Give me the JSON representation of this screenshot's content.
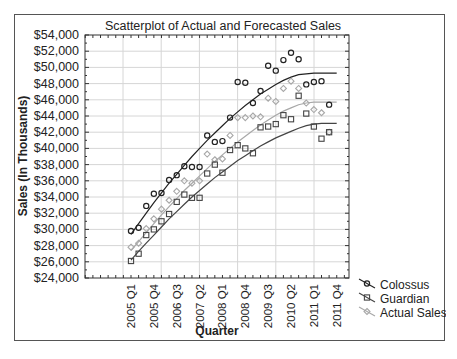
{
  "chart_data": {
    "type": "scatter",
    "title": "Scatterplot of Actual and Forecasted Sales",
    "xlabel": "Quarter",
    "ylabel": "Sales (In Thousands)",
    "ylim": [
      24000,
      54000
    ],
    "ytick_step": 2000,
    "yticks": [
      "$24,000",
      "$26,000",
      "$28,000",
      "$30,000",
      "$32,000",
      "$34,000",
      "$36,000",
      "$38,000",
      "$40,000",
      "$42,000",
      "$44,000",
      "$46,000",
      "$48,000",
      "$50,000",
      "$52,000",
      "$54,000"
    ],
    "xtick_labels": [
      "2005 Q1",
      "2005 Q4",
      "2006 Q3",
      "2007 Q2",
      "2008 Q1",
      "2008 Q4",
      "2009 Q3",
      "2010 Q2",
      "2011 Q1",
      "2011 Q4"
    ],
    "xtick_every": 3,
    "categories": [
      "2005 Q1",
      "2005 Q2",
      "2005 Q3",
      "2005 Q4",
      "2006 Q1",
      "2006 Q2",
      "2006 Q3",
      "2006 Q4",
      "2007 Q1",
      "2007 Q2",
      "2007 Q3",
      "2007 Q4",
      "2008 Q1",
      "2008 Q2",
      "2008 Q3",
      "2008 Q4",
      "2009 Q1",
      "2009 Q2",
      "2009 Q3",
      "2009 Q4",
      "2010 Q1",
      "2010 Q2",
      "2010 Q3",
      "2010 Q4",
      "2011 Q1",
      "2011 Q2",
      "2011 Q3",
      "2011 Q4"
    ],
    "grid": true,
    "legend_position": "right-bottom",
    "series": [
      {
        "name": "Colossus",
        "marker": "circle",
        "color": "#222222",
        "values": [
          29800,
          30200,
          32900,
          34400,
          34500,
          36100,
          36700,
          37800,
          37700,
          37700,
          41600,
          40800,
          40900,
          43800,
          48200,
          48100,
          45600,
          47100,
          50200,
          49600,
          50900,
          51800,
          51000,
          47900,
          48200,
          48300,
          45400,
          null
        ],
        "trend": [
          29400,
          30700,
          32000,
          33300,
          34500,
          35700,
          36800,
          37900,
          39000,
          40000,
          41000,
          41900,
          42800,
          43700,
          44500,
          45300,
          46000,
          46700,
          47300,
          47900,
          48400,
          48800,
          49100,
          49200,
          49300,
          49300,
          49300,
          49300
        ]
      },
      {
        "name": "Guardian",
        "marker": "square",
        "color": "#444444",
        "values": [
          26100,
          27000,
          29300,
          30000,
          31000,
          31900,
          33400,
          34300,
          33900,
          33900,
          36900,
          38000,
          37000,
          39800,
          40400,
          40000,
          39400,
          42600,
          42700,
          43000,
          44100,
          43600,
          46500,
          44300,
          42700,
          41200,
          42000,
          null
        ],
        "trend": [
          26200,
          27300,
          28300,
          29300,
          30300,
          31300,
          32200,
          33100,
          34000,
          34800,
          35600,
          36400,
          37100,
          37800,
          38500,
          39100,
          39700,
          40300,
          40800,
          41300,
          41700,
          42100,
          42500,
          42800,
          43000,
          43100,
          43100,
          43100
        ]
      },
      {
        "name": "Actual Sales",
        "marker": "diamond",
        "color": "#a8a8a8",
        "values": [
          27800,
          28300,
          30100,
          31300,
          32500,
          33600,
          34700,
          36000,
          35700,
          36000,
          39300,
          38600,
          38700,
          41600,
          43800,
          43800,
          44000,
          43900,
          46200,
          45800,
          47400,
          48300,
          47400,
          45600,
          44800,
          44400,
          42000,
          null
        ],
        "trend": [
          27400,
          28500,
          29600,
          30700,
          31800,
          32800,
          33800,
          34800,
          35700,
          36600,
          37500,
          38400,
          39200,
          40000,
          40800,
          41500,
          42200,
          42900,
          43500,
          44100,
          44600,
          45000,
          45400,
          45600,
          45700,
          45700,
          45700,
          45700
        ]
      }
    ]
  }
}
